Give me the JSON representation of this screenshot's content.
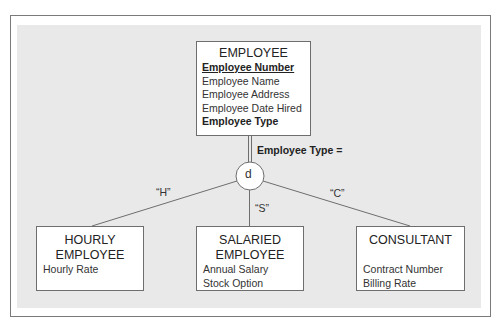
{
  "diagram": {
    "supertype": {
      "name": "EMPLOYEE",
      "attributes": [
        {
          "text": "Employee Number",
          "style": "pk"
        },
        {
          "text": "Employee Name",
          "style": "normal"
        },
        {
          "text": "Employee Address",
          "style": "normal"
        },
        {
          "text": "Employee Date Hired",
          "style": "normal"
        },
        {
          "text": "Employee Type",
          "style": "bold"
        }
      ]
    },
    "discriminator_label": "Employee Type =",
    "disjoint_symbol": "d",
    "subtypes": [
      {
        "name_line1": "HOURLY",
        "name_line2": "EMPLOYEE",
        "value": "“H”",
        "attributes": [
          "Hourly Rate"
        ]
      },
      {
        "name_line1": "SALARIED",
        "name_line2": "EMPLOYEE",
        "value": "“S”",
        "attributes": [
          "Annual Salary",
          "Stock Option"
        ]
      },
      {
        "name_line1": "CONSULTANT",
        "name_line2": "",
        "value": "“C”",
        "attributes": [
          "Contract Number",
          "Billing Rate"
        ]
      }
    ],
    "colors": {
      "panel": "#e9e9e9",
      "box_fill": "#ffffff",
      "line": "#6e6e6e"
    }
  }
}
